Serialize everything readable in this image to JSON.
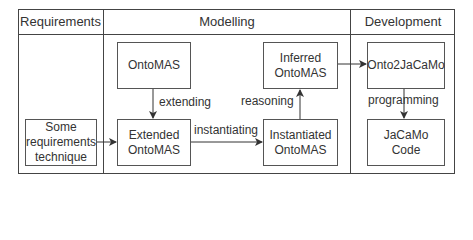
{
  "lanes": [
    {
      "title": "Requirements"
    },
    {
      "title": "Modelling"
    },
    {
      "title": "Development"
    }
  ],
  "nodes": {
    "some_requirements": "Some\nrequirements\ntechnique",
    "ontomas": "OntoMAS",
    "extended_ontomas": "Extended\nOntoMAS",
    "instantiated_ontomas": "Instantiated\nOntoMAS",
    "inferred_ontomas": "Inferred\nOntoMAS",
    "onto2jacamo": "Onto2JaCaMo",
    "jacamo_code": "JaCaMo\nCode"
  },
  "edges": {
    "extending": "extending",
    "instantiating": "instantiating",
    "reasoning": "reasoning",
    "programming": "programming"
  },
  "colors": {
    "line": "#444444",
    "text": "#333333",
    "background": "#ffffff"
  }
}
